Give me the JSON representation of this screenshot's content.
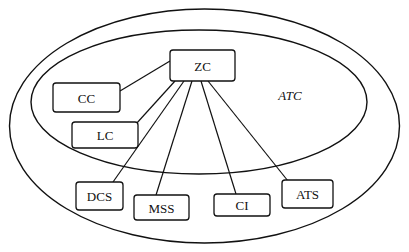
{
  "diagram": {
    "type": "system-architecture",
    "regions": {
      "outer": {
        "label": ""
      },
      "inner": {
        "label": "ATC"
      }
    },
    "nodes": {
      "zc": {
        "label": "ZC"
      },
      "cc": {
        "label": "CC"
      },
      "lc": {
        "label": "LC"
      },
      "dcs": {
        "label": "DCS"
      },
      "mss": {
        "label": "MSS"
      },
      "ci": {
        "label": "CI"
      },
      "ats": {
        "label": "ATS"
      }
    },
    "edges": [
      {
        "from": "ZC",
        "to": "CC"
      },
      {
        "from": "ZC",
        "to": "LC"
      },
      {
        "from": "ZC",
        "to": "DCS"
      },
      {
        "from": "ZC",
        "to": "MSS"
      },
      {
        "from": "ZC",
        "to": "CI"
      },
      {
        "from": "ZC",
        "to": "ATS"
      }
    ],
    "colors": {
      "stroke": "#111111",
      "background": "#ffffff"
    }
  }
}
